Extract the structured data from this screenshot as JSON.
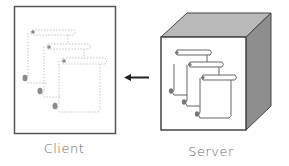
{
  "diagram": {
    "client": {
      "label": "Client",
      "icon": "browser-window-with-cached-scroll-documents"
    },
    "server": {
      "label": "Server",
      "icon": "server-cube-with-scroll-documents"
    },
    "arrow": {
      "direction": "server-to-client",
      "icon": "arrow-left-icon"
    },
    "colors": {
      "outline": "#555555",
      "cube_top": "#b8b8b8",
      "cube_side": "#8f8f8f",
      "dotted_docs": "#bdbdbd",
      "solid_docs": "#777777",
      "label_text": "#666666"
    }
  }
}
